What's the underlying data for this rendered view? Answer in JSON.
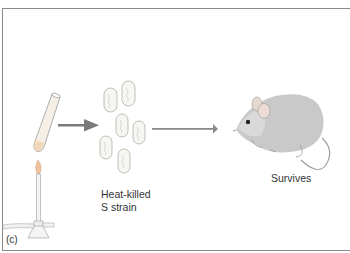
{
  "figure": {
    "panel_label": "(c)",
    "bacteria_label_line1": "Heat-killed",
    "bacteria_label_line2": "S strain",
    "mouse_label": "Survives",
    "icons": [
      "test-tube-icon",
      "bunsen-burner-icon",
      "arrow-right-icon",
      "bacteria-cells-icon",
      "mouse-icon"
    ],
    "colors": {
      "border": "#8a8a8a",
      "arrow": "#7a7a7a",
      "text": "#333333",
      "flame": "#e9a86a"
    }
  }
}
